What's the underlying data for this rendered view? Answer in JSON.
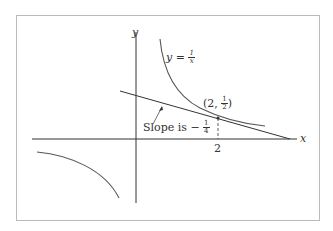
{
  "diagram": {
    "axes": {
      "x_label": "x",
      "y_label": "y"
    },
    "curve_label": {
      "lhs": "y =",
      "num": "1",
      "den": "x"
    },
    "point_label": {
      "open": "(2,",
      "num": "1",
      "den": "2",
      "close": ")"
    },
    "tick_label": "2",
    "slope_label": {
      "text": "Slope is −",
      "num": "1",
      "den": "4"
    },
    "colors": {
      "frame": "#bbbbbb",
      "axis": "#333333",
      "curve": "#555555"
    }
  }
}
